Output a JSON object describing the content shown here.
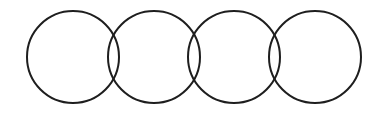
{
  "diagram": {
    "type": "overlapping-circles",
    "background": "#ffffff",
    "stroke_color": "#1e1e1e",
    "stroke_width": 2,
    "circle_count": 4,
    "circles": [
      {
        "cx": 73,
        "cy": 57,
        "r": 46
      },
      {
        "cx": 154,
        "cy": 57,
        "r": 46
      },
      {
        "cx": 234,
        "cy": 57,
        "r": 46
      },
      {
        "cx": 315,
        "cy": 57,
        "r": 46
      }
    ]
  }
}
